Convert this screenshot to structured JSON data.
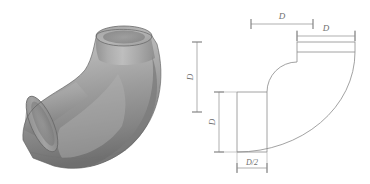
{
  "figure": {
    "kind": "pipe-elbow-figure",
    "panels": [
      {
        "id": "photograph",
        "caption": ""
      },
      {
        "id": "dimensioned-drawing",
        "caption": ""
      }
    ]
  },
  "photo": {
    "subject": "90-degree pipe elbow",
    "rendering": "grayscale photograph",
    "highlight_color": "#c9c9c9",
    "midtone_color": "#9a9a9a",
    "shadow_color": "#6d6d6d",
    "outline_color": "#5a5a5a"
  },
  "drawing": {
    "line_color": "#8a8a8a",
    "dimension_color": "#8c8c8c",
    "text_color": "#6f6f6f",
    "dimensions": [
      {
        "id": "top-outer-width",
        "label": "D",
        "orientation": "horizontal",
        "position": "top-left-span"
      },
      {
        "id": "top-inner-width",
        "label": "D",
        "orientation": "horizontal",
        "position": "top-right-span"
      },
      {
        "id": "left-outer-height",
        "label": "D",
        "orientation": "vertical",
        "position": "far-left"
      },
      {
        "id": "left-inner-height",
        "label": "D",
        "orientation": "vertical",
        "position": "inner-left"
      },
      {
        "id": "leg-width",
        "label": "D/2",
        "orientation": "horizontal",
        "position": "bottom"
      }
    ],
    "geometry": {
      "shape": "quarter-turn elbow profile",
      "arc_type": "two concentric quarter circles",
      "leg_orientation_vertical": "down-left",
      "leg_orientation_horizontal": "top-right"
    }
  }
}
